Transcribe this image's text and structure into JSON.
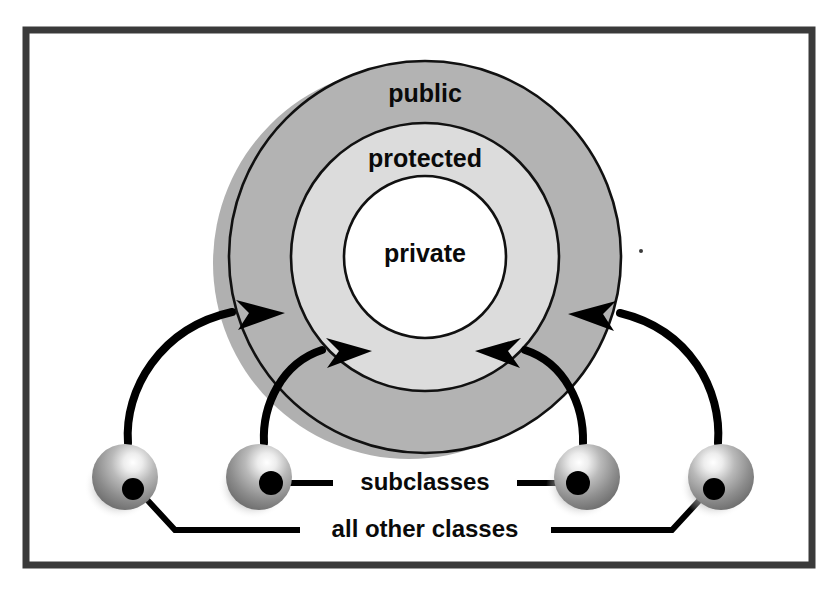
{
  "figure": {
    "background_color": "#ffffff",
    "frame": {
      "name": "outer-frame",
      "border_color": "#3a3a3a",
      "x": 26,
      "y": 30,
      "width": 786,
      "height": 535,
      "border_width": 7
    },
    "rings": [
      {
        "id": "public",
        "label": "public",
        "fill": "#b3b3b3",
        "stroke": "#111111",
        "radius": 196,
        "label_x": 425,
        "label_y": 102
      },
      {
        "id": "protected",
        "label": "protected",
        "fill": "#dcdcdc",
        "stroke": "#111111",
        "radius": 134,
        "label_x": 425,
        "label_y": 167
      },
      {
        "id": "private",
        "label": "private",
        "fill": "#ffffff",
        "stroke": "#111111",
        "radius": 81,
        "label_x": 425,
        "label_y": 262
      }
    ],
    "ring_center": {
      "x": 425,
      "y": 257
    },
    "shadow": {
      "name": "ring-drop-shadow",
      "color": "#b0b0b0",
      "offset_x": -16,
      "offset_y": 6
    },
    "spheres": [
      {
        "id": "sphere-1",
        "cx": 125,
        "cy": 477,
        "r": 33,
        "dot_cx": 133,
        "dot_cy": 489,
        "dot_r": 11
      },
      {
        "id": "sphere-2",
        "cx": 259,
        "cy": 477,
        "r": 33,
        "dot_cx": 271,
        "dot_cy": 483,
        "dot_r": 12
      },
      {
        "id": "sphere-3",
        "cx": 587,
        "cy": 477,
        "r": 33,
        "dot_cx": 578,
        "dot_cy": 483,
        "dot_r": 12
      },
      {
        "id": "sphere-4",
        "cx": 721,
        "cy": 477,
        "r": 33,
        "dot_cx": 714,
        "dot_cy": 489,
        "dot_r": 11
      }
    ],
    "sphere_colors": {
      "highlight": "#f2f2f2",
      "mid": "#9a9a9a",
      "shade": "#6e6e6e",
      "dot": "#000000"
    },
    "arrows": [
      {
        "id": "arrow-outer-left",
        "from": "sphere-1",
        "to": "public",
        "path": "M 128 443 C 124 390 160 328 232 312",
        "head": "M 236 300 L 285 313 L 238 330 L 249 313 Z"
      },
      {
        "id": "arrow-protected-left",
        "from": "sphere-2",
        "to": "protected",
        "path": "M 264 443 C 262 405 282 363 322 350",
        "head": "M 326 338 L 372 351 L 327 368 L 339 351 Z"
      },
      {
        "id": "arrow-protected-right",
        "from": "sphere-3",
        "to": "protected",
        "path": "M 583 443 C 584 405 565 363 525 350",
        "head": "M 521 338 L 475 351 L 520 368 L 508 351 Z"
      },
      {
        "id": "arrow-outer-right",
        "from": "sphere-4",
        "to": "public",
        "path": "M 718 443 C 722 390 690 330 620 313",
        "head": "M 616 301 L 568 314 L 614 331 L 603 314 Z"
      }
    ],
    "callouts": [
      {
        "id": "subclasses",
        "label": "subclasses",
        "label_x": 425,
        "label_y": 490,
        "leader_left": {
          "x1": 279,
          "y1": 483,
          "x2": 333,
          "y2": 483
        },
        "leader_right": {
          "x1": 517,
          "y1": 483,
          "x2": 570,
          "y2": 483
        }
      },
      {
        "id": "all-other-classes",
        "label": "all other classes",
        "label_x": 425,
        "label_y": 537,
        "leader_left": {
          "points": "139,491 175,530 300,530"
        },
        "leader_right": {
          "points": "708,491 672,530 551,530"
        }
      }
    ],
    "artifacts": [
      {
        "id": "speck-right",
        "cx": 641,
        "cy": 251,
        "r": 2,
        "color": "#3a3a3a"
      }
    ]
  }
}
